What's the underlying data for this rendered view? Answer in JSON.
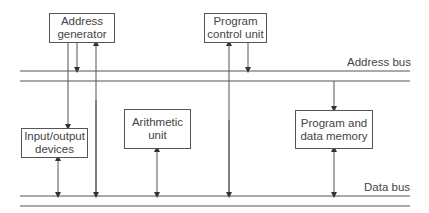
{
  "diagram": {
    "title": "",
    "buses": {
      "address": {
        "label": "Address bus"
      },
      "data": {
        "label": "Data bus"
      }
    },
    "blocks": {
      "address_generator": {
        "line1": "Address",
        "line2": "generator"
      },
      "program_control_unit": {
        "line1": "Program",
        "line2": "control unit"
      },
      "io_devices": {
        "line1": "Input/output",
        "line2": "devices"
      },
      "arithmetic_unit": {
        "line1": "Arithmetic",
        "line2": "unit"
      },
      "memory": {
        "line1": "Program and",
        "line2": "data memory"
      }
    },
    "connections": [
      {
        "from": "address_generator",
        "to": "address_bus",
        "direction": "one-way"
      },
      {
        "from": "address_generator",
        "to": "io_devices",
        "direction": "one-way"
      },
      {
        "from": "data_bus",
        "to": "address_generator",
        "direction": "one-way"
      },
      {
        "from": "program_control_unit",
        "to": "address_bus",
        "direction": "one-way"
      },
      {
        "from": "data_bus",
        "to": "program_control_unit",
        "direction": "one-way"
      },
      {
        "from": "address_bus",
        "to": "memory",
        "direction": "one-way"
      },
      {
        "from": "io_devices",
        "to": "data_bus",
        "direction": "two-way"
      },
      {
        "from": "arithmetic_unit",
        "to": "data_bus",
        "direction": "two-way"
      },
      {
        "from": "memory",
        "to": "data_bus",
        "direction": "two-way"
      }
    ],
    "colors": {
      "line": "#555555",
      "text": "#444444",
      "background": "#ffffff"
    }
  }
}
